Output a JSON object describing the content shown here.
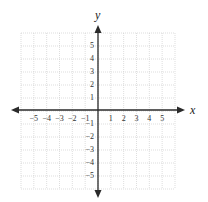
{
  "diagram": {
    "type": "coordinate-plane",
    "axes": {
      "x_label": "x",
      "y_label": "y",
      "x_range": [
        -6,
        6
      ],
      "y_range": [
        -6,
        6
      ]
    },
    "x_tick_labels": [
      "−5",
      "−4",
      "−3",
      "−2",
      "−1",
      "1",
      "2",
      "3",
      "4",
      "5"
    ],
    "x_tick_values": [
      -5,
      -4,
      -3,
      -2,
      -1,
      1,
      2,
      3,
      4,
      5
    ],
    "y_tick_labels": [
      "5",
      "4",
      "3",
      "2",
      "1",
      "−1",
      "−2",
      "−3",
      "−4",
      "−5"
    ],
    "y_tick_values": [
      5,
      4,
      3,
      2,
      1,
      -1,
      -2,
      -3,
      -4,
      -5
    ],
    "grid": {
      "cells_x": 12,
      "cells_y": 12,
      "style": "dotted"
    },
    "colors": {
      "axis": "#2a2a2a",
      "grid": "#c8c8c8",
      "background": "#ffffff"
    }
  }
}
